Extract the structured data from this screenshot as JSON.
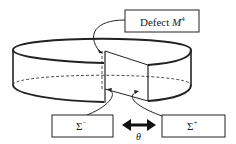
{
  "figure": {
    "type": "diagram",
    "labels": {
      "defect": {
        "prefix": "Defect ",
        "symbol": "M",
        "superscript": "4"
      },
      "sigma_minus": {
        "symbol": "Σ",
        "superscript": "−"
      },
      "sigma_plus": {
        "symbol": "Σ",
        "superscript": "+"
      },
      "angle": "θ"
    },
    "colors": {
      "stroke": "#222222",
      "background": "#ffffff"
    }
  }
}
